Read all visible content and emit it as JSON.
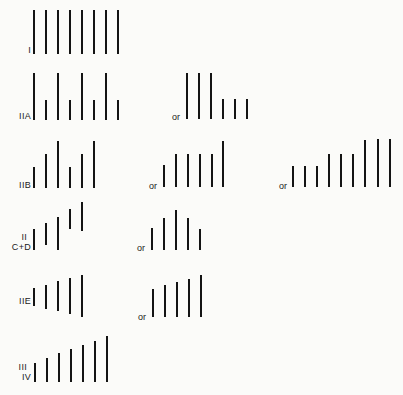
{
  "diagram": {
    "bar_color": "#141414",
    "background": "#fbfbf9",
    "connector_label": "or",
    "rows": [
      {
        "id": "I",
        "label_lines": [
          "I"
        ],
        "patterns": [
          {
            "name": "I-main",
            "bars": [
              {
                "x": 33,
                "top": 10,
                "bottom": 54
              },
              {
                "x": 45,
                "top": 10,
                "bottom": 54
              },
              {
                "x": 57,
                "top": 10,
                "bottom": 54
              },
              {
                "x": 69,
                "top": 10,
                "bottom": 54
              },
              {
                "x": 81,
                "top": 10,
                "bottom": 54
              },
              {
                "x": 93,
                "top": 10,
                "bottom": 54
              },
              {
                "x": 105,
                "top": 10,
                "bottom": 54
              },
              {
                "x": 117,
                "top": 10,
                "bottom": 54
              }
            ]
          }
        ]
      },
      {
        "id": "IIA",
        "label_lines": [
          "IIA"
        ],
        "patterns": [
          {
            "name": "IIA-main",
            "bars": [
              {
                "x": 33,
                "top": 73,
                "bottom": 120
              },
              {
                "x": 45,
                "top": 100,
                "bottom": 120
              },
              {
                "x": 57,
                "top": 73,
                "bottom": 120
              },
              {
                "x": 69,
                "top": 100,
                "bottom": 120
              },
              {
                "x": 81,
                "top": 73,
                "bottom": 120
              },
              {
                "x": 93,
                "top": 100,
                "bottom": 120
              },
              {
                "x": 105,
                "top": 73,
                "bottom": 120
              },
              {
                "x": 117,
                "top": 100,
                "bottom": 120
              }
            ]
          },
          {
            "name": "IIA-alt",
            "or": {
              "x": 172,
              "y": 112
            },
            "bars": [
              {
                "x": 186,
                "top": 73,
                "bottom": 119
              },
              {
                "x": 198,
                "top": 73,
                "bottom": 119
              },
              {
                "x": 210,
                "top": 73,
                "bottom": 119
              },
              {
                "x": 222,
                "top": 99,
                "bottom": 119
              },
              {
                "x": 234,
                "top": 99,
                "bottom": 119
              },
              {
                "x": 246,
                "top": 99,
                "bottom": 119
              }
            ]
          }
        ]
      },
      {
        "id": "IIB",
        "label_lines": [
          "IIB"
        ],
        "patterns": [
          {
            "name": "IIB-main",
            "bars": [
              {
                "x": 33,
                "top": 167,
                "bottom": 188
              },
              {
                "x": 45,
                "top": 154,
                "bottom": 188
              },
              {
                "x": 57,
                "top": 141,
                "bottom": 188
              },
              {
                "x": 69,
                "top": 167,
                "bottom": 188
              },
              {
                "x": 81,
                "top": 154,
                "bottom": 188
              },
              {
                "x": 93,
                "top": 141,
                "bottom": 188
              }
            ]
          },
          {
            "name": "IIB-alt1",
            "or": {
              "x": 149,
              "y": 181
            },
            "bars": [
              {
                "x": 163,
                "top": 165,
                "bottom": 187
              },
              {
                "x": 175,
                "top": 154,
                "bottom": 187
              },
              {
                "x": 187,
                "top": 154,
                "bottom": 187
              },
              {
                "x": 199,
                "top": 154,
                "bottom": 187
              },
              {
                "x": 211,
                "top": 154,
                "bottom": 187
              },
              {
                "x": 222,
                "top": 141,
                "bottom": 187
              }
            ]
          },
          {
            "name": "IIB-alt2",
            "or": {
              "x": 279,
              "y": 181
            },
            "bars": [
              {
                "x": 292,
                "top": 166,
                "bottom": 187
              },
              {
                "x": 304,
                "top": 166,
                "bottom": 187
              },
              {
                "x": 316,
                "top": 166,
                "bottom": 187
              },
              {
                "x": 328,
                "top": 154,
                "bottom": 187
              },
              {
                "x": 340,
                "top": 154,
                "bottom": 187
              },
              {
                "x": 352,
                "top": 154,
                "bottom": 187
              },
              {
                "x": 364,
                "top": 140,
                "bottom": 187
              },
              {
                "x": 377,
                "top": 139,
                "bottom": 187
              },
              {
                "x": 389,
                "top": 139,
                "bottom": 187
              }
            ]
          }
        ]
      },
      {
        "id": "IIC+D",
        "label_lines": [
          "II",
          "C+D"
        ],
        "patterns": [
          {
            "name": "IICD-main",
            "bars": [
              {
                "x": 33,
                "top": 229,
                "bottom": 250
              },
              {
                "x": 45,
                "top": 223,
                "bottom": 245
              },
              {
                "x": 57,
                "top": 217,
                "bottom": 250
              },
              {
                "x": 69,
                "top": 209,
                "bottom": 229
              },
              {
                "x": 81,
                "top": 202,
                "bottom": 231
              }
            ]
          },
          {
            "name": "IICD-alt",
            "or": {
              "x": 137,
              "y": 243
            },
            "bars": [
              {
                "x": 151,
                "top": 228,
                "bottom": 250
              },
              {
                "x": 163,
                "top": 218,
                "bottom": 250
              },
              {
                "x": 175,
                "top": 210,
                "bottom": 250
              },
              {
                "x": 187,
                "top": 218,
                "bottom": 250
              },
              {
                "x": 199,
                "top": 229,
                "bottom": 250
              }
            ]
          }
        ]
      },
      {
        "id": "IIE",
        "label_lines": [
          "IIE"
        ],
        "patterns": [
          {
            "name": "IIE-main",
            "bars": [
              {
                "x": 33,
                "top": 288,
                "bottom": 306
              },
              {
                "x": 45,
                "top": 285,
                "bottom": 309
              },
              {
                "x": 57,
                "top": 281,
                "bottom": 311
              },
              {
                "x": 69,
                "top": 278,
                "bottom": 314
              },
              {
                "x": 81,
                "top": 275,
                "bottom": 317
              }
            ]
          },
          {
            "name": "IIE-alt",
            "or": {
              "x": 138,
              "y": 312
            },
            "bars": [
              {
                "x": 152,
                "top": 289,
                "bottom": 317
              },
              {
                "x": 164,
                "top": 285,
                "bottom": 317
              },
              {
                "x": 176,
                "top": 282,
                "bottom": 317
              },
              {
                "x": 188,
                "top": 279,
                "bottom": 317
              },
              {
                "x": 200,
                "top": 275,
                "bottom": 317
              }
            ]
          }
        ]
      },
      {
        "id": "III/IV",
        "label_lines": [
          "III",
          "IV"
        ],
        "patterns": [
          {
            "name": "IIIIV-main",
            "bars": [
              {
                "x": 34,
                "top": 363,
                "bottom": 382
              },
              {
                "x": 46,
                "top": 358,
                "bottom": 382
              },
              {
                "x": 58,
                "top": 353,
                "bottom": 382
              },
              {
                "x": 70,
                "top": 349,
                "bottom": 382
              },
              {
                "x": 82,
                "top": 345,
                "bottom": 382
              },
              {
                "x": 94,
                "top": 341,
                "bottom": 382
              },
              {
                "x": 106,
                "top": 336,
                "bottom": 382
              }
            ]
          }
        ]
      }
    ],
    "labels": [
      {
        "row": "I",
        "lines": [
          "I"
        ],
        "right": 31,
        "y": 45
      },
      {
        "row": "IIA",
        "lines": [
          "IIA"
        ],
        "right": 31,
        "y": 111
      },
      {
        "row": "IIB",
        "lines": [
          "IIB"
        ],
        "right": 31,
        "y": 180
      },
      {
        "row": "IIC+D",
        "lines": [
          "II",
          "C+D"
        ],
        "right": 31,
        "y": 232
      },
      {
        "row": "IIE",
        "lines": [
          "IIE"
        ],
        "right": 31,
        "y": 296
      },
      {
        "row": "III/IV",
        "lines": [
          "III",
          "IV"
        ],
        "right": 31,
        "y": 362
      }
    ]
  }
}
